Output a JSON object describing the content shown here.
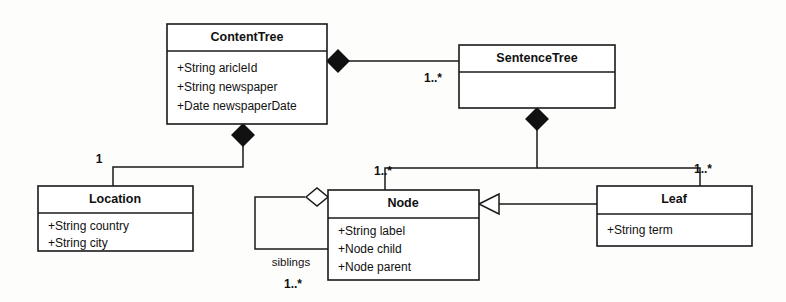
{
  "diagram": {
    "kind": "uml-class-diagram",
    "canvas": {
      "width": 786,
      "height": 302
    },
    "background_color": "#fdfdfc",
    "line_color": "#1a1a1a",
    "fill_color": "#ffffff"
  },
  "classes": {
    "content_tree": {
      "name": "ContentTree",
      "attributes": [
        "+String aricleId",
        "+String newspaper",
        "+Date   newspaperDate"
      ]
    },
    "sentence_tree": {
      "name": "SentenceTree",
      "attributes": []
    },
    "location": {
      "name": "Location",
      "attributes": [
        "+String country",
        "+String city"
      ]
    },
    "node": {
      "name": "Node",
      "attributes": [
        "+String label",
        "+Node child",
        "+Node parent"
      ]
    },
    "leaf": {
      "name": "Leaf",
      "attributes": [
        "+String term"
      ]
    }
  },
  "relationships": {
    "content_to_sentence": {
      "type": "composition",
      "multiplicity": "1..*"
    },
    "content_to_location": {
      "type": "composition",
      "multiplicity": "1"
    },
    "sentence_to_node": {
      "type": "composition",
      "multiplicity": "1..*"
    },
    "sentence_to_leaf": {
      "type": "composition",
      "multiplicity": "1..*"
    },
    "leaf_to_node": {
      "type": "generalization",
      "multiplicity": ""
    },
    "node_siblings": {
      "type": "aggregation",
      "role": "siblings",
      "multiplicity": "1..*"
    }
  }
}
